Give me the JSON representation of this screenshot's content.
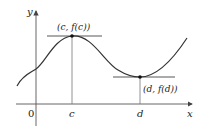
{
  "diagram": {
    "type": "function-graph",
    "axes": {
      "x_label": "x",
      "y_label": "y",
      "origin_label": "0"
    },
    "tick_labels": {
      "c": "c",
      "d": "d"
    },
    "points": {
      "max": {
        "label": "(c, f(c))",
        "kind": "local maximum"
      },
      "min": {
        "label": "(d, f(d))",
        "kind": "local minimum"
      }
    },
    "colors": {
      "curve": "#333333",
      "axes": "#555555",
      "guides": "#777777"
    }
  }
}
